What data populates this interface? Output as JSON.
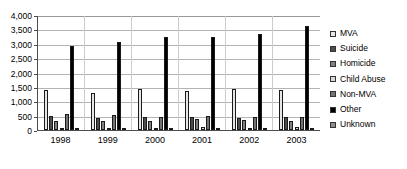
{
  "chart_data": {
    "type": "bar",
    "title": "",
    "subtitle": "",
    "xlabel": "",
    "ylabel": "",
    "categories": [
      "1998",
      "1999",
      "2000",
      "2001",
      "2002",
      "2003"
    ],
    "ylim": [
      0,
      4000
    ],
    "ytick_values": [
      0,
      500,
      1000,
      1500,
      2000,
      2500,
      3000,
      3500,
      4000
    ],
    "ytick_labels": [
      "0",
      "500",
      "1,000",
      "1,500",
      "2,000",
      "2,500",
      "3,000",
      "3,500",
      "4,000"
    ],
    "grid": true,
    "legend_position": "right",
    "series": [
      {
        "name": "MVA",
        "color": "#e6e6e6",
        "values": [
          1380,
          1300,
          1430,
          1350,
          1440,
          1390
        ]
      },
      {
        "name": "Suicide",
        "color": "#4d4d4d",
        "values": [
          490,
          430,
          460,
          450,
          420,
          450
        ]
      },
      {
        "name": "Homicide",
        "color": "#808080",
        "values": [
          330,
          310,
          330,
          370,
          350,
          330
        ]
      },
      {
        "name": "Child Abuse",
        "color": "#d9d9d9",
        "values": [
          80,
          70,
          70,
          90,
          70,
          120
        ]
      },
      {
        "name": "Non-MVA",
        "color": "#737373",
        "values": [
          540,
          510,
          460,
          480,
          470,
          440
        ]
      },
      {
        "name": "Other",
        "color": "#000000",
        "values": [
          2920,
          3060,
          3220,
          3250,
          3330,
          3610
        ]
      },
      {
        "name": "Unknown",
        "color": "#8c8c8c",
        "values": [
          30,
          40,
          10,
          10,
          10,
          10
        ]
      }
    ]
  },
  "legend": {
    "items": [
      {
        "label": "MVA",
        "swatch": "legend-swatch-mva"
      },
      {
        "label": "Suicide",
        "swatch": "legend-swatch-suicide"
      },
      {
        "label": "Homicide",
        "swatch": "legend-swatch-homicide"
      },
      {
        "label": "Child Abuse",
        "swatch": "legend-swatch-child-abuse"
      },
      {
        "label": "Non-MVA",
        "swatch": "legend-swatch-non-mva"
      },
      {
        "label": "Other",
        "swatch": "legend-swatch-other"
      },
      {
        "label": "Unknown",
        "swatch": "legend-swatch-unknown"
      }
    ]
  },
  "colors": {
    "axis": "#4d4d4d",
    "gridline": "#b3b3b3",
    "background": "#ffffff",
    "text": "#000000"
  }
}
